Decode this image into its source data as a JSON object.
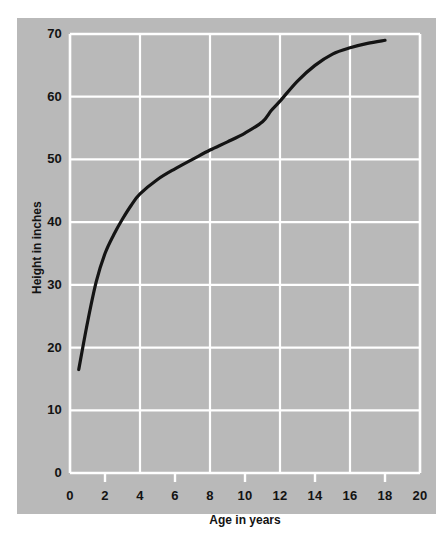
{
  "chart_data": {
    "type": "line",
    "title": "",
    "xlabel": "Age in years",
    "ylabel": "Height in inches",
    "xlim": [
      0,
      20
    ],
    "ylim": [
      0,
      70
    ],
    "xticks": [
      "0",
      "2",
      "4",
      "6",
      "8",
      "10",
      "12",
      "14",
      "16",
      "18",
      "20"
    ],
    "xtick_values": [
      0,
      2,
      4,
      6,
      8,
      10,
      12,
      14,
      16,
      18,
      20
    ],
    "yticks": [
      "0",
      "10",
      "20",
      "30",
      "40",
      "50",
      "60",
      "70"
    ],
    "ytick_values": [
      0,
      10,
      20,
      30,
      40,
      50,
      60,
      70
    ],
    "gridlines_x": [
      4,
      8,
      12,
      16
    ],
    "gridlines_y": [
      10,
      20,
      30,
      40,
      50,
      60,
      70
    ],
    "grid": true,
    "legend": "none",
    "series": [
      {
        "name": "Height growth curve",
        "x": [
          0.5,
          1,
          1.5,
          2,
          2.5,
          3,
          3.5,
          4,
          5,
          6,
          7,
          8,
          9,
          10,
          11,
          11.5,
          12,
          13,
          14,
          15,
          16,
          17,
          18
        ],
        "values": [
          16.5,
          24,
          30.5,
          35,
          38,
          40.5,
          42.7,
          44.5,
          46.8,
          48.5,
          50,
          51.5,
          52.8,
          54.2,
          56,
          57.8,
          59.3,
          62.5,
          65,
          66.8,
          67.8,
          68.5,
          69
        ]
      }
    ],
    "colors": {
      "panel_background": "#b9b9b9",
      "figure_background": "#ffffff",
      "grid": "#ffffff",
      "axis": "#ffffff",
      "line": "#141414",
      "text": "#131313"
    }
  }
}
